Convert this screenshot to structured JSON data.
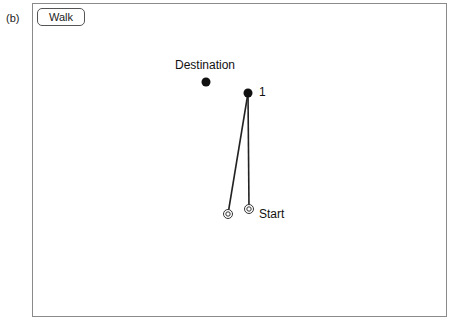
{
  "panel_label": "(b)",
  "toolbar": {
    "walk_label": "Walk"
  },
  "labels": {
    "destination": "Destination",
    "point_1": "1",
    "start": "Start"
  },
  "points": {
    "destination": {
      "x": 206,
      "y": 82
    },
    "point_1": {
      "x": 248,
      "y": 93
    },
    "start_a": {
      "x": 228,
      "y": 214
    },
    "start_b": {
      "x": 249,
      "y": 209
    }
  },
  "colors": {
    "frame": "#8a8a8a",
    "ink": "#111111"
  }
}
